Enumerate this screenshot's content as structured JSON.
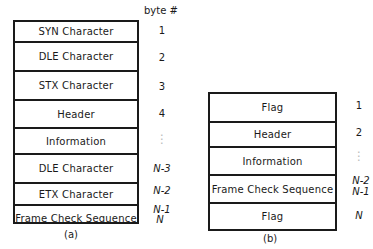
{
  "frame_a": {
    "byte_header": "byte #",
    "caption": "(a)",
    "fields": [
      {
        "label": "SYN Character",
        "byte": "1"
      },
      {
        "label": "DLE Character",
        "byte": "2"
      },
      {
        "label": "STX Character",
        "byte": "3"
      },
      {
        "label": "Header",
        "byte": "4"
      },
      {
        "label": "Information",
        "byte": "⋮"
      },
      {
        "label": "DLE Character",
        "byte": "N-3"
      },
      {
        "label": "ETX Character",
        "byte": "N-2"
      },
      {
        "label": "Frame Check Sequence",
        "byte": "N-1",
        "byte2": "N"
      }
    ]
  },
  "frame_b": {
    "caption": "(b)",
    "fields": [
      {
        "label": "Flag",
        "byte": "1"
      },
      {
        "label": "Header",
        "byte": "2"
      },
      {
        "label": "Information",
        "byte": "⋮"
      },
      {
        "label": "Frame Check Sequence",
        "byte": "N-2",
        "byte2": "N-1"
      },
      {
        "label": "Flag",
        "byte": "N"
      }
    ]
  }
}
